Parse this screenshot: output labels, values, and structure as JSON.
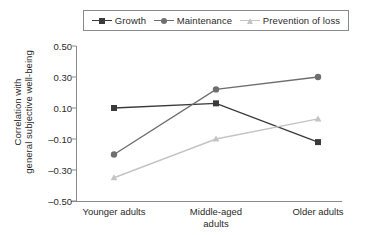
{
  "chart_data": {
    "type": "line",
    "title": "",
    "xlabel": "",
    "ylabel": "Correlation with general subjective well-being",
    "ylabel_lines": [
      "Correlation with",
      "general subjective well-being"
    ],
    "categories": [
      "Younger adults",
      "Middle-aged adults",
      "Older adults"
    ],
    "category_lines": [
      [
        "Younger adults"
      ],
      [
        "Middle-aged",
        "adults"
      ],
      [
        "Older adults"
      ]
    ],
    "ylim": [
      -0.5,
      0.5
    ],
    "ytick_values": [
      0.5,
      0.3,
      0.1,
      -0.1,
      -0.3,
      -0.5
    ],
    "ytick_labels": [
      "0.50",
      "0.30",
      "0.10",
      "–0.10",
      "–0.30",
      "–0.50"
    ],
    "grid": false,
    "legend_position": "top",
    "series": [
      {
        "name": "Growth",
        "values": [
          0.1,
          0.13,
          -0.12
        ],
        "color": "#3a3a3a",
        "marker": "square"
      },
      {
        "name": "Maintenance",
        "values": [
          -0.2,
          0.22,
          0.3
        ],
        "color": "#6e6e6e",
        "marker": "circle"
      },
      {
        "name": "Prevention of loss",
        "values": [
          -0.35,
          -0.1,
          0.03
        ],
        "color": "#c4c4c4",
        "marker": "triangle"
      }
    ]
  },
  "legend": {
    "entries": [
      {
        "label": "Growth"
      },
      {
        "label": "Maintenance"
      },
      {
        "label": "Prevention of loss"
      }
    ]
  },
  "axis": {
    "y_title_line1": "Correlation with",
    "y_title_line2": "general subjective well-being"
  }
}
